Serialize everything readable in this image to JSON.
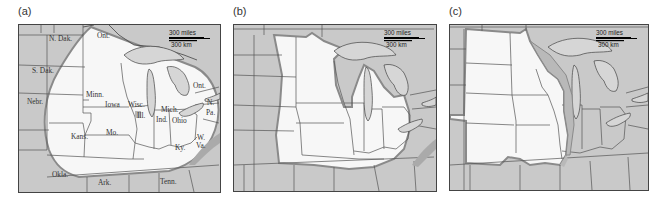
{
  "figure": {
    "panels": [
      {
        "id": "a",
        "label": "(a)",
        "scale_bar": {
          "miles": "300 miles",
          "km": "300 km"
        },
        "state_labels": [
          {
            "text": "N. Dak.",
            "x": 30,
            "y": 16
          },
          {
            "text": "S. Dak.",
            "x": 13,
            "y": 48
          },
          {
            "text": "Nebr.",
            "x": 8,
            "y": 79
          },
          {
            "text": "Minn.",
            "x": 67,
            "y": 72
          },
          {
            "text": "Iowa",
            "x": 86,
            "y": 82
          },
          {
            "text": "Wisc.",
            "x": 109,
            "y": 82
          },
          {
            "text": "Ill.",
            "x": 118,
            "y": 93
          },
          {
            "text": "Mich.",
            "x": 142,
            "y": 87
          },
          {
            "text": "Ind.",
            "x": 137,
            "y": 97
          },
          {
            "text": "Ohio",
            "x": 153,
            "y": 98
          },
          {
            "text": "Ont.",
            "x": 78,
            "y": 13
          },
          {
            "text": "Ont.",
            "x": 174,
            "y": 63
          },
          {
            "text": "N.",
            "x": 188,
            "y": 80
          },
          {
            "text": "Pa.",
            "x": 187,
            "y": 90
          },
          {
            "text": "Mo.",
            "x": 87,
            "y": 110
          },
          {
            "text": "Kans.",
            "x": 52,
            "y": 114
          },
          {
            "text": "Ky.",
            "x": 156,
            "y": 125
          },
          {
            "text": "W.",
            "x": 178,
            "y": 115
          },
          {
            "text": "Va.",
            "x": 177,
            "y": 123
          },
          {
            "text": "Okla.",
            "x": 33,
            "y": 152
          },
          {
            "text": "Ark.",
            "x": 79,
            "y": 160
          },
          {
            "text": "Tenn.",
            "x": 141,
            "y": 159
          }
        ]
      },
      {
        "id": "b",
        "label": "(b)",
        "scale_bar": {
          "miles": "300 miles",
          "km": "300 km"
        },
        "state_labels": []
      },
      {
        "id": "c",
        "label": "(c)",
        "scale_bar": {
          "miles": "300 miles",
          "km": "300 km"
        },
        "state_labels": []
      }
    ],
    "colors": {
      "land_outside": "#c9c9c9",
      "region_inside": "#f7f7f7",
      "region_border": "#8a8a8a",
      "lakes": "#d6d6d6",
      "state_lines": "#555555"
    }
  }
}
